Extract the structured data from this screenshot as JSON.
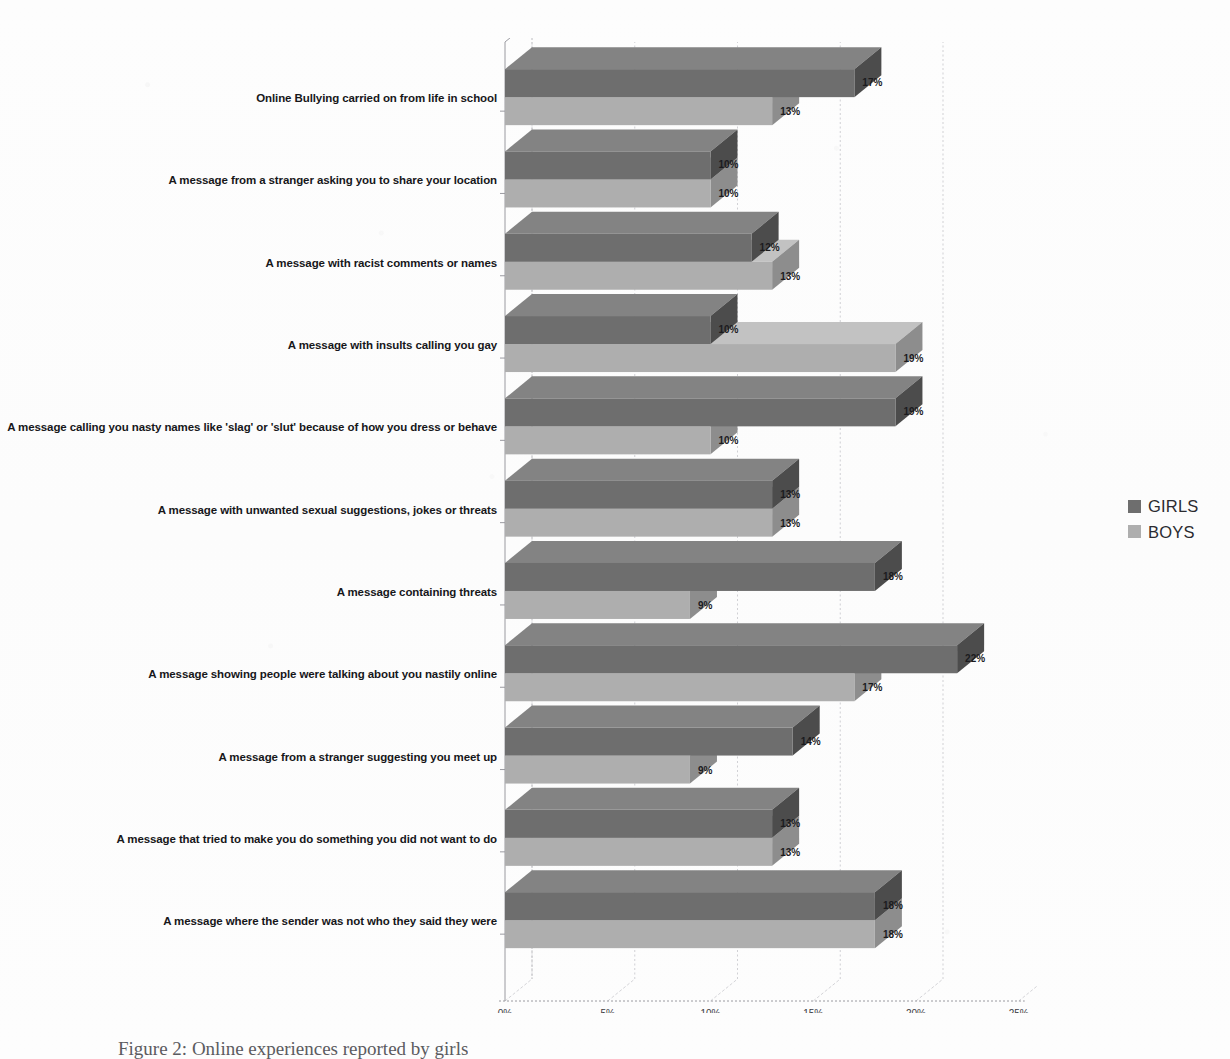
{
  "chart_data": {
    "type": "bar",
    "orientation": "horizontal",
    "title": "",
    "xlabel": "",
    "ylabel": "",
    "xlim": [
      0,
      25
    ],
    "xticks": [
      "0%",
      "5%",
      "10%",
      "15%",
      "20%",
      "25%"
    ],
    "xtick_values": [
      0,
      5,
      10,
      15,
      20,
      25
    ],
    "grid": true,
    "grid_axis": "x",
    "legend_position": "right",
    "value_label_suffix": "%",
    "categories": [
      "Online Bullying carried on from life in school",
      "A message from a stranger asking you to share your location",
      "A message with racist comments or names",
      "A message with insults calling you gay",
      "A message calling you nasty names like 'slag' or 'slut' because of how you dress or behave",
      "A message with unwanted sexual suggestions, jokes or threats",
      "A message containing threats",
      "A message showing people were talking about you nastily online",
      "A message from a stranger suggesting you meet up",
      "A message that tried to make you do something you did not want to do",
      "A message where the sender was not who they said they were"
    ],
    "series": [
      {
        "name": "GIRLS",
        "color": "#6e6e6e",
        "values": [
          17,
          10,
          12,
          10,
          19,
          13,
          18,
          22,
          14,
          13,
          18
        ],
        "labels": [
          "17%",
          "10%",
          "12%",
          "10%",
          "19%",
          "13%",
          "18%",
          "22%",
          "14%",
          "13%",
          "18%"
        ]
      },
      {
        "name": "BOYS",
        "color": "#aeaeae",
        "values": [
          13,
          10,
          13,
          19,
          10,
          13,
          9,
          17,
          9,
          13,
          18
        ],
        "labels": [
          "13%",
          "10%",
          "13%",
          "19%",
          "10%",
          "13%",
          "9%",
          "17%",
          "9%",
          "13%",
          "18%"
        ]
      }
    ]
  },
  "legend": {
    "items": [
      {
        "label": "GIRLS",
        "color": "#6e6e6e"
      },
      {
        "label": "BOYS",
        "color": "#aeaeae"
      }
    ]
  },
  "caption": {
    "text": "Figure 2: Online experiences reported by girls"
  },
  "colors": {
    "girls": "#6e6e6e",
    "girls_side": "#4c4c4c",
    "girls_top": "#838383",
    "boys": "#aeaeae",
    "boys_side": "#8d8d8d",
    "boys_top": "#c2c2c2",
    "axis": "#9a9aa0",
    "grid": "#b9b9bf",
    "text": "#17171a"
  }
}
